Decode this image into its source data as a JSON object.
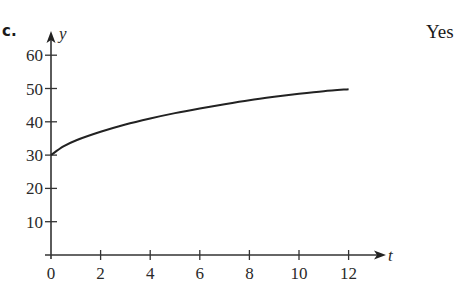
{
  "label": "c.",
  "answer": "Yes",
  "chart_data": {
    "type": "line",
    "title": "",
    "xlabel": "t",
    "ylabel": "y",
    "xlim": [
      0,
      13.5
    ],
    "ylim": [
      0,
      65
    ],
    "x_ticks": [
      0,
      2,
      4,
      6,
      8,
      10,
      12
    ],
    "y_ticks": [
      10,
      20,
      30,
      40,
      50,
      60
    ],
    "grid": false,
    "legend": null,
    "series": [
      {
        "name": "y(t)",
        "x": [
          0,
          0.5,
          1,
          2,
          3,
          4,
          5,
          6,
          7,
          8,
          9,
          10,
          11,
          12
        ],
        "values": [
          30,
          32.6,
          34.4,
          37.0,
          39.2,
          41.0,
          42.6,
          44.0,
          45.3,
          46.5,
          47.5,
          48.4,
          49.2,
          49.8
        ]
      }
    ]
  }
}
